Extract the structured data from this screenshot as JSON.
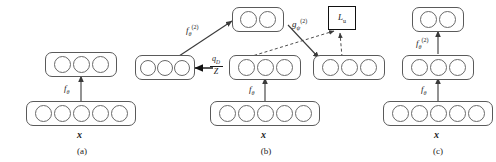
{
  "figure": {
    "type": "diagram"
  },
  "panels": [
    {
      "id": "a",
      "caption": "(a)",
      "input_label": "x",
      "layers": [
        {
          "name": "input-layer",
          "units": 5
        },
        {
          "name": "hidden-layer",
          "units": 3
        }
      ],
      "edges": [
        {
          "label_base": "f",
          "label_sub": "θ",
          "label_sup": ""
        }
      ]
    },
    {
      "id": "b",
      "caption": "(b)",
      "input_label": "x",
      "layers": [
        {
          "name": "input-layer",
          "units": 5
        },
        {
          "name": "encoder-layer",
          "units": 3
        },
        {
          "name": "masked-layer",
          "units": 3
        },
        {
          "name": "top-layer",
          "units": 2
        },
        {
          "name": "right-layer",
          "units": 3
        }
      ],
      "edges": [
        {
          "label_base": "f",
          "label_sub": "θ",
          "label_sup": ""
        },
        {
          "label_base": "f",
          "label_sub": "θ",
          "label_sup": "(2)"
        },
        {
          "label_base": "g",
          "label_sub": "ψ",
          "label_sup": "(2)"
        }
      ],
      "fraction": {
        "numerator_base": "q",
        "numerator_sub": "D",
        "denominator": "Z"
      },
      "loss": {
        "base": "L",
        "sub": "u"
      },
      "mask_marker": "x-mark"
    },
    {
      "id": "c",
      "caption": "(c)",
      "input_label": "x",
      "layers": [
        {
          "name": "input-layer",
          "units": 5
        },
        {
          "name": "hidden-layer",
          "units": 3
        },
        {
          "name": "output-layer",
          "units": 2
        }
      ],
      "edges": [
        {
          "label_base": "f",
          "label_sub": "θ",
          "label_sup": ""
        },
        {
          "label_base": "f",
          "label_sub": "θ",
          "label_sup": "(2)"
        }
      ]
    }
  ],
  "colors": {
    "stroke": "#5a5a5a",
    "unit_stroke": "#6a6a6a",
    "arrow": "#3a3a3a",
    "loss_border": "#111111",
    "text": "#1a1a1a",
    "background": "#ffffff"
  }
}
